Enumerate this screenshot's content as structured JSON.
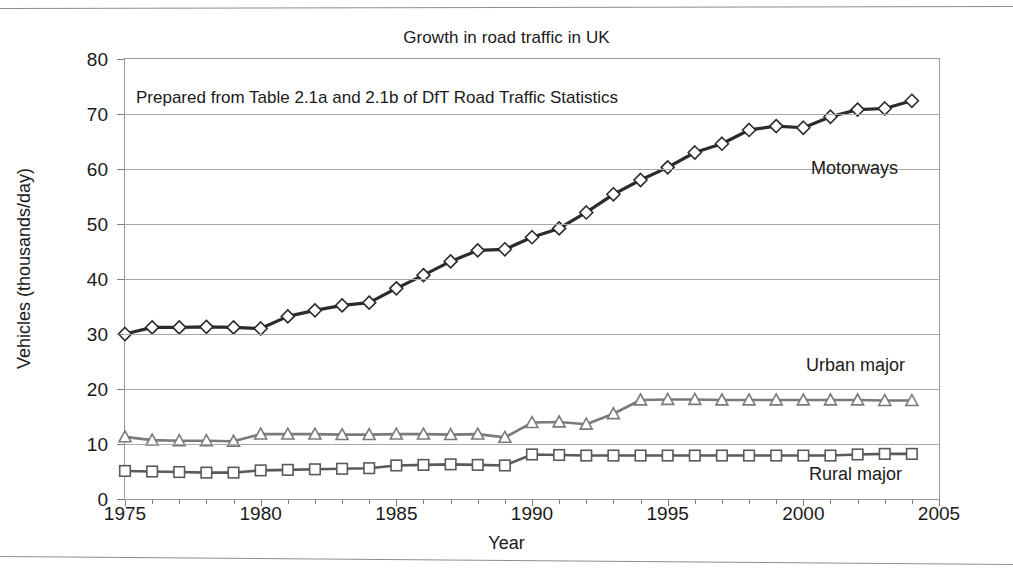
{
  "chart_data": {
    "type": "line",
    "title": "Growth in road traffic in UK",
    "subtitle": "Prepared from Table 2.1a and 2.1b of DfT Road Traffic Statistics",
    "xlabel": "Year",
    "ylabel": "Vehicles (thousands/day)",
    "xlim": [
      1975,
      2005
    ],
    "ylim": [
      0,
      80
    ],
    "xticks": [
      1975,
      1980,
      1985,
      1990,
      1995,
      2000,
      2005
    ],
    "yticks": [
      0,
      10,
      20,
      30,
      40,
      50,
      60,
      70,
      80
    ],
    "xtick_labels": [
      "1975",
      "1980",
      "1985",
      "1990",
      "1995",
      "2000",
      "2005"
    ],
    "ytick_labels": [
      "0",
      "10",
      "20",
      "30",
      "40",
      "50",
      "60",
      "70",
      "80"
    ],
    "grid": "horizontal",
    "legend_position": "inline-annotations",
    "x": [
      1975,
      1976,
      1977,
      1978,
      1979,
      1980,
      1981,
      1982,
      1983,
      1984,
      1985,
      1986,
      1987,
      1988,
      1989,
      1990,
      1991,
      1992,
      1993,
      1994,
      1995,
      1996,
      1997,
      1998,
      1999,
      2000,
      2001,
      2002,
      2003,
      2004
    ],
    "series": [
      {
        "name": "Motorways",
        "marker": "diamond",
        "color": "#2b2b2b",
        "values": [
          30.0,
          31.2,
          31.2,
          31.3,
          31.2,
          31.0,
          33.2,
          34.3,
          35.2,
          35.7,
          38.3,
          40.7,
          43.2,
          45.2,
          45.4,
          47.6,
          49.2,
          52.1,
          55.4,
          58.0,
          60.3,
          63.0,
          64.6,
          67.1,
          67.8,
          67.5,
          69.5,
          70.8,
          71.0,
          72.4
        ]
      },
      {
        "name": "Urban major",
        "marker": "triangle",
        "color": "#7a7a7a",
        "values": [
          11.3,
          10.7,
          10.6,
          10.6,
          10.5,
          11.8,
          11.8,
          11.8,
          11.7,
          11.7,
          11.8,
          11.8,
          11.7,
          11.8,
          11.2,
          13.9,
          14.0,
          13.6,
          15.5,
          18.0,
          18.1,
          18.1,
          18.0,
          18.0,
          18.0,
          18.0,
          18.0,
          18.0,
          17.9,
          17.9
        ]
      },
      {
        "name": "Rural major",
        "marker": "square",
        "color": "#5a5a5a",
        "values": [
          5.1,
          5.0,
          4.9,
          4.8,
          4.8,
          5.2,
          5.3,
          5.4,
          5.5,
          5.6,
          6.1,
          6.2,
          6.3,
          6.2,
          6.1,
          8.1,
          8.0,
          7.9,
          7.9,
          7.9,
          7.9,
          7.9,
          7.9,
          7.9,
          7.9,
          7.9,
          7.9,
          8.1,
          8.2,
          8.2
        ]
      }
    ],
    "annotations": [
      {
        "text": "Motorways",
        "x": 2001,
        "y": 58
      },
      {
        "text": "Urban major",
        "x": 2001,
        "y": 24
      },
      {
        "text": "Rural major",
        "x": 2001,
        "y": 4
      }
    ]
  }
}
